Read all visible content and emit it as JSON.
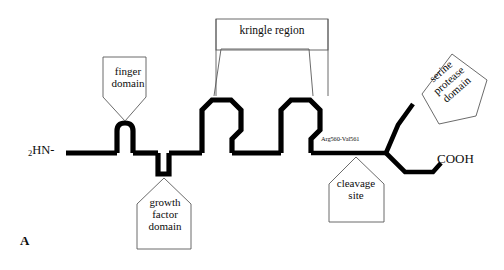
{
  "figure": {
    "panel_label": "A",
    "terminus_n": "HN-",
    "terminus_n_subscript": "2",
    "terminus_c": "COOH",
    "cleavage_residues": "Arg560-Val561",
    "backbone_color": "#000000",
    "callout_outline_color": "#5a5a5a",
    "background_color": "#ffffff"
  },
  "callouts": {
    "finger": "finger\ndomain",
    "kringle": "kringle region",
    "growth_factor": "growth\nfactor\ndomain",
    "cleavage": "cleavage\nsite",
    "serine_protease": "serine\nprotease\ndomain"
  },
  "diagram_data": {
    "type": "domain-structure-schematic",
    "molecule": "tissue plasminogen activator (t-PA) chain",
    "orientation": "N-terminus left to C-terminus right",
    "domains": [
      {
        "name": "finger domain",
        "shape": "small-square-loop",
        "order": 1
      },
      {
        "name": "growth factor domain",
        "shape": "downward-stub",
        "order": 2
      },
      {
        "name": "kringle 1",
        "shape": "octagon-loop",
        "order": 3
      },
      {
        "name": "kringle 2",
        "shape": "octagon-loop",
        "order": 4
      },
      {
        "name": "serine protease domain",
        "shape": "branch-up-right",
        "order": 5
      }
    ],
    "cleavage_site": {
      "label": "Arg560-Val561",
      "position": "between kringle 2 and serine protease domain"
    }
  }
}
